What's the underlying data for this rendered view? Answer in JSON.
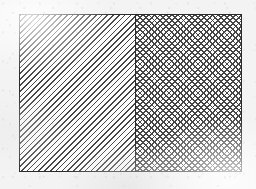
{
  "figure": {
    "canvas": {
      "width_px": 256,
      "height_px": 189,
      "background_color": "#f3f3f3",
      "texture": "scanned-paper-speckle"
    },
    "rectangle": {
      "name": "outer-rectangle",
      "x_px": 19,
      "y_px": 14,
      "width_px": 223,
      "height_px": 158,
      "border_color": "#2b2b2b",
      "border_width_px": 1,
      "fill_color": "#ffffff"
    },
    "divider": {
      "name": "vertical-divider",
      "x_px": 134,
      "orientation": "vertical",
      "color": "#2b2b2b",
      "width_px": 1
    },
    "regions": [
      {
        "id": "left",
        "label": "",
        "hatch_style": "single-diagonal",
        "hatch_direction": "backslash",
        "hatch_angle_deg": 135,
        "hatch_spacing_px": 4,
        "hatch_line_color": "#3a3a3a",
        "fill_color": "#fdfdfd",
        "width_px": 115,
        "share": "left-half"
      },
      {
        "id": "right",
        "label": "",
        "hatch_style": "cross-hatch",
        "hatch_direction": "both",
        "hatch_angle_deg": "45 / 135",
        "hatch_spacing_px": 4,
        "hatch_line_color": "#3a3a3a",
        "fill_color": "#fdfdfd",
        "width_px": 107,
        "share": "right-half"
      }
    ]
  }
}
